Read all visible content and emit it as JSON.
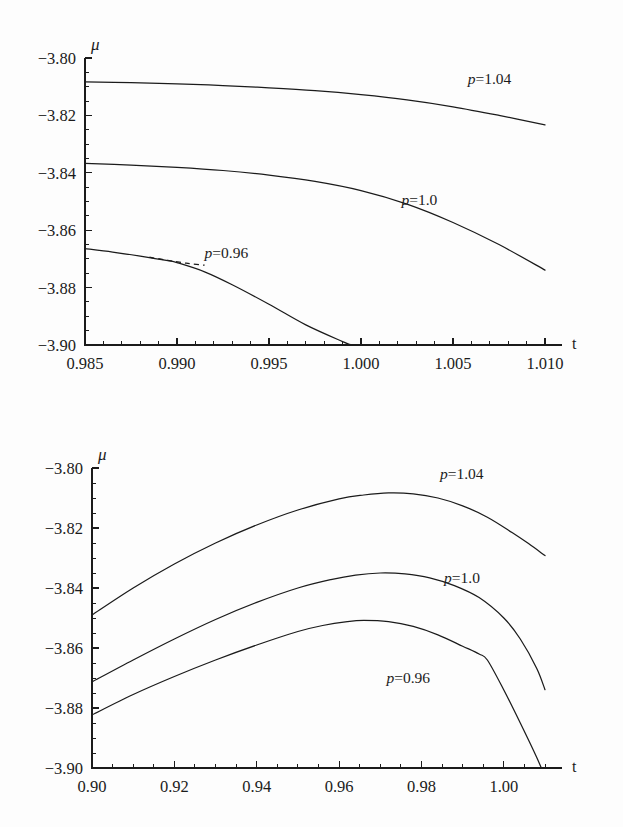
{
  "page": {
    "background_color": "#fdfdfd",
    "ink_color": "#1b1b1b",
    "header_fragment": ""
  },
  "chart_data": [
    {
      "id": "top-panel",
      "type": "line",
      "title": "",
      "subtitle": "",
      "xlabel": "t",
      "ylabel": "μ",
      "xlim": [
        0.985,
        1.01
      ],
      "ylim": [
        -3.9,
        -3.8
      ],
      "xticks": [
        0.985,
        0.99,
        0.995,
        1.0,
        1.005,
        1.01
      ],
      "xticklabels": [
        "0.985",
        "0.990",
        "0.995",
        "1.000",
        "1.005",
        "1.010"
      ],
      "yticks": [
        -3.9,
        -3.88,
        -3.86,
        -3.84,
        -3.82,
        -3.8
      ],
      "yticklabels": [
        "−3.90",
        "−3.88",
        "−3.86",
        "−3.84",
        "−3.82",
        "−3.80"
      ],
      "x_minor_per_interval": 5,
      "y_minor_per_interval": 4,
      "grid": false,
      "legend_position": "inline-annotation",
      "series": [
        {
          "name": "p=1.04",
          "label_text": "p=1.04",
          "label_at": {
            "x": 1.0058,
            "y": -3.8092
          },
          "style": "solid",
          "x": [
            0.985,
            0.9875,
            0.99,
            0.9925,
            0.995,
            0.9975,
            1.0,
            1.0025,
            1.005,
            1.0075,
            1.01
          ],
          "y": [
            -3.8083,
            -3.8086,
            -3.809,
            -3.8096,
            -3.8104,
            -3.8114,
            -3.8128,
            -3.8146,
            -3.817,
            -3.82,
            -3.8233
          ]
        },
        {
          "name": "p=1.0",
          "label_text": "p=1.0",
          "label_at": {
            "x": 1.0022,
            "y": -3.8513
          },
          "style": "solid",
          "x": [
            0.985,
            0.9875,
            0.99,
            0.9925,
            0.995,
            0.9975,
            1.0,
            1.0025,
            1.005,
            1.0075,
            1.01
          ],
          "y": [
            -3.8367,
            -3.8373,
            -3.8381,
            -3.8392,
            -3.8408,
            -3.843,
            -3.8462,
            -3.8509,
            -3.8573,
            -3.865,
            -3.8739
          ]
        },
        {
          "name": "p=0.96",
          "label_text": "p=0.96",
          "label_at": {
            "x": 0.9915,
            "y": -3.8697
          },
          "style": "solid",
          "x": [
            0.985,
            0.9865,
            0.988,
            0.9895,
            0.99,
            0.9915,
            0.993,
            0.995,
            0.997,
            0.999,
            0.9995
          ],
          "y": [
            -3.8664,
            -3.8676,
            -3.869,
            -3.8706,
            -3.8713,
            -3.8745,
            -3.879,
            -3.8858,
            -3.893,
            -3.8988,
            -3.9
          ]
        },
        {
          "name": "p=0.96-branch",
          "label_text": "",
          "style": "dashed",
          "x": [
            0.9885,
            0.9895,
            0.9905,
            0.9915
          ],
          "y": [
            -3.8694,
            -3.8705,
            -3.8715,
            -3.8722
          ]
        }
      ]
    },
    {
      "id": "bottom-panel",
      "type": "line",
      "title": "",
      "subtitle": "",
      "xlabel": "t",
      "ylabel": "μ",
      "xlim": [
        0.9,
        1.01
      ],
      "ylim": [
        -3.9,
        -3.8
      ],
      "xticks": [
        0.9,
        0.92,
        0.94,
        0.96,
        0.98,
        1.0
      ],
      "xticklabels": [
        "0.90",
        "0.92",
        "0.94",
        "0.96",
        "0.98",
        "1.00"
      ],
      "yticks": [
        -3.9,
        -3.88,
        -3.86,
        -3.84,
        -3.82,
        -3.8
      ],
      "yticklabels": [
        "−3.90",
        "−3.88",
        "−3.86",
        "−3.84",
        "−3.82",
        "−3.80"
      ],
      "x_minor_per_interval": 4,
      "y_minor_per_interval": 4,
      "grid": false,
      "legend_position": "inline-annotation",
      "series": [
        {
          "name": "p=1.04",
          "label_text": "p=1.04",
          "label_at": {
            "x": 0.9845,
            "y": -3.8035
          },
          "style": "solid",
          "x": [
            0.9,
            0.91,
            0.92,
            0.93,
            0.94,
            0.95,
            0.96,
            0.966,
            0.972,
            0.978,
            0.984,
            0.99,
            0.996,
            1.002,
            1.006,
            1.01
          ],
          "y": [
            -3.849,
            -3.84,
            -3.832,
            -3.825,
            -3.819,
            -3.814,
            -3.8103,
            -3.809,
            -3.8083,
            -3.8086,
            -3.81,
            -3.8126,
            -3.8164,
            -3.8215,
            -3.8252,
            -3.8292
          ]
        },
        {
          "name": "p=1.0",
          "label_text": "p=1.0",
          "label_at": {
            "x": 0.9855,
            "y": -3.8383
          },
          "style": "solid",
          "x": [
            0.9,
            0.91,
            0.92,
            0.93,
            0.94,
            0.95,
            0.958,
            0.964,
            0.97,
            0.976,
            0.982,
            0.988,
            0.994,
            1.0,
            1.004,
            1.008,
            1.01
          ],
          "y": [
            -3.8713,
            -3.864,
            -3.857,
            -3.8505,
            -3.8448,
            -3.84,
            -3.8372,
            -3.8357,
            -3.835,
            -3.8353,
            -3.8366,
            -3.8392,
            -3.8432,
            -3.85,
            -3.857,
            -3.8668,
            -3.8739
          ]
        },
        {
          "name": "p=0.96",
          "label_text": "p=0.96",
          "label_at": {
            "x": 0.9715,
            "y": -3.8717
          },
          "style": "solid",
          "x": [
            0.9,
            0.91,
            0.92,
            0.93,
            0.94,
            0.95,
            0.956,
            0.962,
            0.966,
            0.972,
            0.978,
            0.984,
            0.99,
            0.994,
            0.996,
            1.0,
            1.004,
            1.008,
            1.01
          ],
          "y": [
            -3.8823,
            -3.8755,
            -3.8695,
            -3.864,
            -3.859,
            -3.8545,
            -3.8525,
            -3.8512,
            -3.8508,
            -3.8512,
            -3.8528,
            -3.8556,
            -3.8594,
            -3.862,
            -3.864,
            -3.874,
            -3.885,
            -3.8965,
            -3.903
          ]
        }
      ]
    }
  ]
}
